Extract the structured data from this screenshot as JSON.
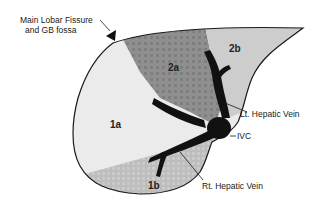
{
  "diagram": {
    "colors": {
      "background": "#ffffff",
      "outline": "#1a1a1a",
      "seg_1a": "#e9e9e9",
      "seg_1b": "#c4c4c4",
      "seg_2a": "#8a8a8a",
      "seg_2b": "#cdcdcd",
      "vein": "#111111"
    },
    "callouts": {
      "fissure_line1": "Main Lobar Fissure",
      "fissure_line2": "and GB fossa",
      "lt_hepatic_vein": "Lt. Hepatic Vein",
      "ivc": "IVC",
      "rt_hepatic_vein": "Rt. Hepatic Vein"
    },
    "segments": {
      "s1a": "1a",
      "s1b": "1b",
      "s2a": "2a",
      "s2b": "2b"
    }
  }
}
